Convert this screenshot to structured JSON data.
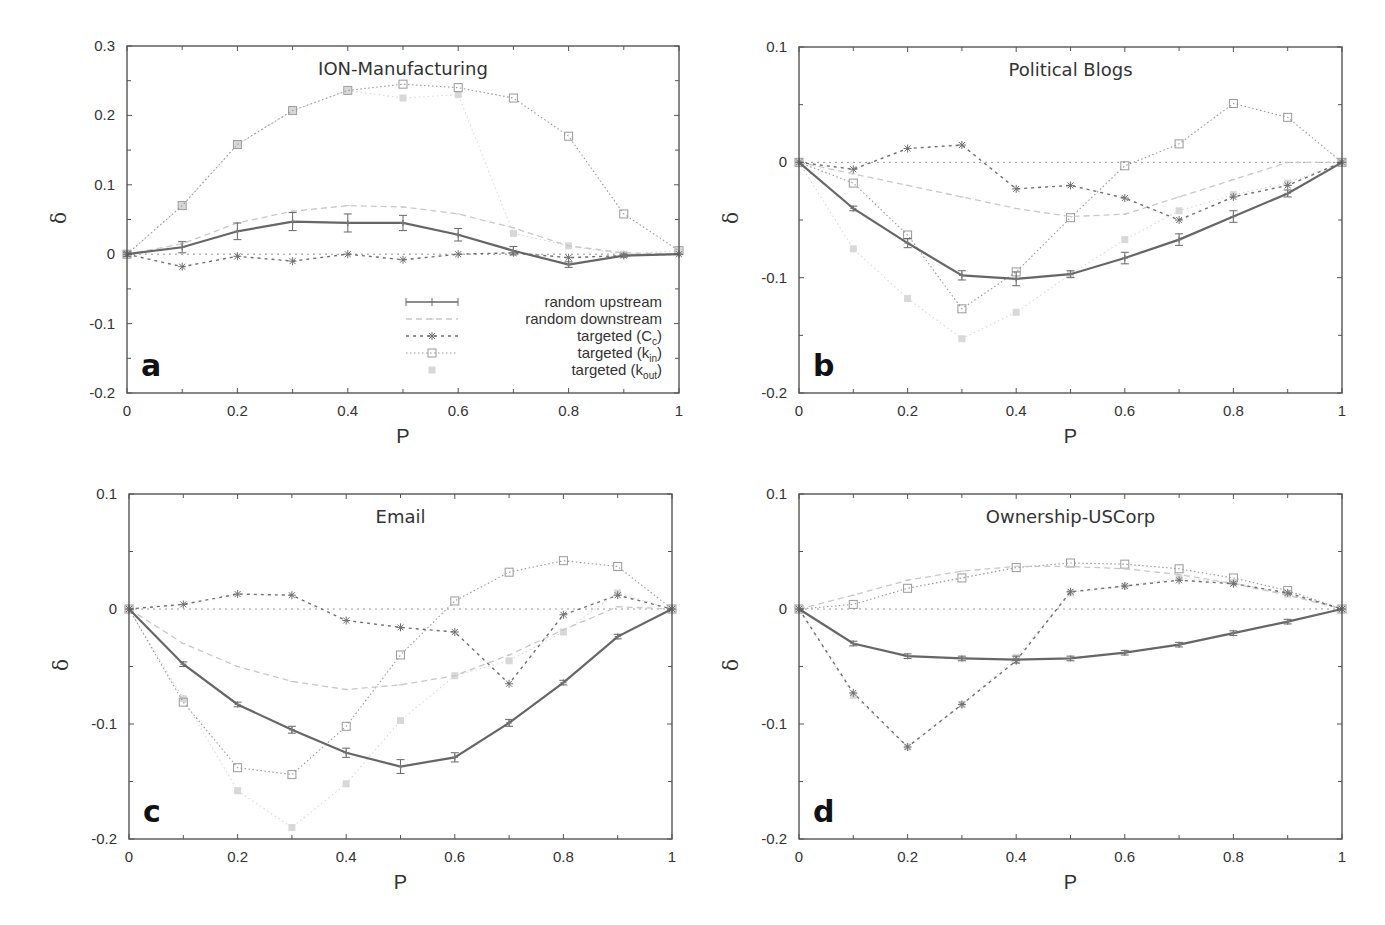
{
  "figure": {
    "legend": [
      {
        "key": "up",
        "label": "random upstream",
        "sub": "",
        "prefix": ""
      },
      {
        "key": "down",
        "label": "random downstream",
        "sub": "",
        "prefix": ""
      },
      {
        "key": "cc",
        "label": "targeted (C",
        "sub": "c",
        "suffix": ")"
      },
      {
        "key": "kin",
        "label": "targeted (k",
        "sub": "in",
        "suffix": ")"
      },
      {
        "key": "kout",
        "label": "targeted (k",
        "sub": "out",
        "suffix": ")"
      }
    ],
    "styles": {
      "up": {
        "color": "#666666",
        "width": 2.2,
        "dash": "",
        "marker": "plus",
        "errorbars": true
      },
      "down": {
        "color": "#c8c8c8",
        "width": 1.3,
        "dash": "6,4",
        "marker": "tick",
        "errorbars": false
      },
      "cc": {
        "color": "#707070",
        "width": 1.4,
        "dash": "3,4",
        "marker": "star",
        "errorbars": false
      },
      "kin": {
        "color": "#9a9a9a",
        "width": 1.1,
        "dash": "1.5,2.5",
        "marker": "square",
        "errorbars": false
      },
      "kout": {
        "color": "#d8d8d8",
        "width": 1.1,
        "dash": "1.5,3",
        "marker": "filled-square",
        "errorbars": false
      }
    }
  },
  "chart_data": [
    {
      "type": "line",
      "panel": "a",
      "title": "ION-Manufacturing",
      "xlabel": "P",
      "ylabel": "δ",
      "xlim": [
        0,
        1
      ],
      "ylim": [
        -0.2,
        0.3
      ],
      "xticks": [
        "0",
        "0.2",
        "0.4",
        "0.6",
        "0.8",
        "1"
      ],
      "yticks": [
        "-0.2",
        "-0.1",
        "0",
        "0.1",
        "0.2",
        "0.3"
      ],
      "ytick_values": [
        -0.2,
        -0.1,
        0,
        0.1,
        0.2,
        0.3
      ],
      "grid": false,
      "legend_position": "lower right",
      "box": {
        "left": 127,
        "top": 46,
        "right": 679,
        "bottom": 393
      },
      "x": [
        0,
        0.1,
        0.2,
        0.3,
        0.4,
        0.5,
        0.6,
        0.7,
        0.8,
        0.9,
        1.0
      ],
      "series": [
        {
          "key": "up",
          "name": "random upstream",
          "values": [
            0,
            0.01,
            0.033,
            0.047,
            0.045,
            0.045,
            0.028,
            0.005,
            -0.015,
            -0.002,
            0
          ],
          "err": [
            0.003,
            0.008,
            0.012,
            0.013,
            0.013,
            0.011,
            0.009,
            0.006,
            0.004,
            0.002,
            0
          ]
        },
        {
          "key": "down",
          "name": "random downstream",
          "values": [
            0,
            0.015,
            0.045,
            0.062,
            0.07,
            0.068,
            0.058,
            0.038,
            0.012,
            0.002,
            0
          ]
        },
        {
          "key": "cc",
          "name": "targeted (Cc)",
          "values": [
            0,
            -0.018,
            -0.003,
            -0.01,
            0.0,
            -0.008,
            0.0,
            0.002,
            -0.005,
            -0.002,
            0
          ]
        },
        {
          "key": "kin",
          "name": "targeted (kin)",
          "values": [
            0,
            0.07,
            0.158,
            0.207,
            0.236,
            0.245,
            0.24,
            0.225,
            0.17,
            0.058,
            0.005
          ]
        },
        {
          "key": "kout",
          "name": "targeted (kout)",
          "values": [
            0,
            0.07,
            0.158,
            0.207,
            0.236,
            0.225,
            0.23,
            0.03,
            0.012,
            0.0,
            0.005
          ]
        }
      ]
    },
    {
      "type": "line",
      "panel": "b",
      "title": "Political Blogs",
      "xlabel": "P",
      "ylabel": "δ",
      "xlim": [
        0,
        1
      ],
      "ylim": [
        -0.2,
        0.1
      ],
      "xticks": [
        "0",
        "0.2",
        "0.4",
        "0.6",
        "0.8",
        "1"
      ],
      "yticks": [
        "-0.2",
        "-0.1",
        "0",
        "0.1"
      ],
      "ytick_values": [
        -0.2,
        -0.1,
        0,
        0.1
      ],
      "grid": false,
      "box": {
        "left": 799,
        "top": 47,
        "right": 1342,
        "bottom": 393
      },
      "x": [
        0,
        0.1,
        0.2,
        0.3,
        0.4,
        0.5,
        0.6,
        0.7,
        0.8,
        0.9,
        1.0
      ],
      "series": [
        {
          "key": "up",
          "name": "random upstream",
          "values": [
            0,
            -0.04,
            -0.07,
            -0.098,
            -0.101,
            -0.097,
            -0.083,
            -0.067,
            -0.047,
            -0.027,
            0
          ],
          "err": [
            0,
            0.002,
            0.004,
            0.004,
            0.006,
            0.003,
            0.005,
            0.005,
            0.005,
            0.003,
            0
          ]
        },
        {
          "key": "down",
          "name": "random downstream",
          "values": [
            0,
            -0.01,
            -0.02,
            -0.03,
            -0.04,
            -0.047,
            -0.045,
            -0.03,
            -0.015,
            0.0,
            0
          ]
        },
        {
          "key": "cc",
          "name": "targeted (Cc)",
          "values": [
            0,
            -0.006,
            0.012,
            0.015,
            -0.023,
            -0.02,
            -0.031,
            -0.05,
            -0.03,
            -0.02,
            0
          ]
        },
        {
          "key": "kin",
          "name": "targeted (kin)",
          "values": [
            0,
            -0.018,
            -0.063,
            -0.127,
            -0.095,
            -0.048,
            -0.003,
            0.016,
            0.051,
            0.039,
            0
          ]
        },
        {
          "key": "kout",
          "name": "targeted (kout)",
          "values": [
            0,
            -0.075,
            -0.118,
            -0.153,
            -0.13,
            -0.097,
            -0.067,
            -0.042,
            -0.028,
            -0.018,
            0
          ]
        }
      ]
    },
    {
      "type": "line",
      "panel": "c",
      "title": "Email",
      "xlabel": "P",
      "ylabel": "δ",
      "xlim": [
        0,
        1
      ],
      "ylim": [
        -0.2,
        0.1
      ],
      "xticks": [
        "0",
        "0.2",
        "0.4",
        "0.6",
        "0.8",
        "1"
      ],
      "yticks": [
        "-0.2",
        "-0.1",
        "0",
        "0.1"
      ],
      "ytick_values": [
        -0.2,
        -0.1,
        0,
        0.1
      ],
      "grid": false,
      "box": {
        "left": 129,
        "top": 494,
        "right": 672,
        "bottom": 839
      },
      "x": [
        0,
        0.1,
        0.2,
        0.3,
        0.4,
        0.5,
        0.6,
        0.7,
        0.8,
        0.9,
        1.0
      ],
      "series": [
        {
          "key": "up",
          "name": "random upstream",
          "values": [
            0,
            -0.048,
            -0.083,
            -0.105,
            -0.125,
            -0.137,
            -0.129,
            -0.099,
            -0.064,
            -0.024,
            0
          ],
          "err": [
            0,
            0.002,
            0.002,
            0.003,
            0.004,
            0.006,
            0.004,
            0.003,
            0.002,
            0.002,
            0
          ]
        },
        {
          "key": "down",
          "name": "random downstream",
          "values": [
            0,
            -0.03,
            -0.05,
            -0.063,
            -0.07,
            -0.066,
            -0.058,
            -0.04,
            -0.018,
            0.002,
            0
          ]
        },
        {
          "key": "cc",
          "name": "targeted (Cc)",
          "values": [
            0,
            0.004,
            0.013,
            0.012,
            -0.01,
            -0.016,
            -0.02,
            -0.065,
            -0.005,
            0.012,
            0
          ]
        },
        {
          "key": "kin",
          "name": "targeted (kin)",
          "values": [
            0,
            -0.081,
            -0.138,
            -0.144,
            -0.102,
            -0.04,
            0.007,
            0.032,
            0.042,
            0.037,
            0
          ]
        },
        {
          "key": "kout",
          "name": "targeted (kout)",
          "values": [
            0,
            -0.078,
            -0.158,
            -0.19,
            -0.152,
            -0.097,
            -0.058,
            -0.045,
            -0.02,
            0.014,
            0
          ]
        }
      ]
    },
    {
      "type": "line",
      "panel": "d",
      "title": "Ownership-USCorp",
      "xlabel": "P",
      "ylabel": "δ",
      "xlim": [
        0,
        1
      ],
      "ylim": [
        -0.2,
        0.1
      ],
      "xticks": [
        "0",
        "0.2",
        "0.4",
        "0.6",
        "0.8",
        "1"
      ],
      "yticks": [
        "-0.2",
        "-0.1",
        "0",
        "0.1"
      ],
      "ytick_values": [
        -0.2,
        -0.1,
        0,
        0.1
      ],
      "grid": false,
      "box": {
        "left": 799,
        "top": 494,
        "right": 1342,
        "bottom": 839
      },
      "x": [
        0,
        0.1,
        0.2,
        0.3,
        0.4,
        0.5,
        0.6,
        0.7,
        0.8,
        0.9,
        1.0
      ],
      "series": [
        {
          "key": "up",
          "name": "random upstream",
          "values": [
            0,
            -0.03,
            -0.041,
            -0.043,
            -0.044,
            -0.043,
            -0.038,
            -0.031,
            -0.021,
            -0.011,
            0
          ],
          "err": [
            0,
            0.002,
            0.002,
            0.002,
            0.003,
            0.002,
            0.002,
            0.002,
            0.002,
            0.002,
            0
          ]
        },
        {
          "key": "down",
          "name": "random downstream",
          "values": [
            0,
            0.012,
            0.025,
            0.033,
            0.037,
            0.037,
            0.035,
            0.03,
            0.022,
            0.012,
            0
          ]
        },
        {
          "key": "cc",
          "name": "targeted (Cc)",
          "values": [
            0,
            -0.073,
            -0.12,
            -0.083,
            -0.045,
            0.015,
            0.02,
            0.025,
            0.022,
            0.014,
            0
          ]
        },
        {
          "key": "kin",
          "name": "targeted (kin)",
          "values": [
            0,
            0.004,
            0.018,
            0.027,
            0.036,
            0.04,
            0.039,
            0.035,
            0.027,
            0.016,
            0
          ]
        },
        {
          "key": "kout",
          "name": "targeted (kout)",
          "values": [
            0,
            -0.075,
            -0.12,
            -0.083,
            -0.042,
            0.014,
            0.02,
            0.027,
            0.023,
            0.013,
            0
          ]
        }
      ]
    }
  ]
}
